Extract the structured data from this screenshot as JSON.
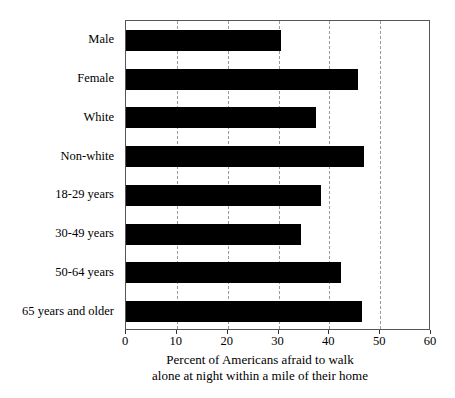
{
  "chart_data": {
    "type": "bar",
    "orientation": "horizontal",
    "title": "",
    "xlabel": "Percent of Americans afraid to walk alone at night within a mile of their home",
    "ylabel": "",
    "xlim": [
      0,
      60
    ],
    "xticks": [
      0,
      10,
      20,
      30,
      40,
      50,
      60
    ],
    "xtick_labels": [
      "0",
      "10",
      "20",
      "30",
      "40",
      "50",
      "60"
    ],
    "gridlines": [
      10,
      20,
      30,
      40,
      50
    ],
    "grid": true,
    "legend": "none",
    "bar_color": "#000000",
    "categories": [
      "Male",
      "Female",
      "White",
      "Non-white",
      "18-29 years",
      "30-49 years",
      "50-64 years",
      "65 years and older"
    ],
    "values": [
      30.5,
      45.6,
      37.4,
      46.8,
      38.4,
      34.4,
      42.3,
      46.4
    ]
  },
  "axis_title": {
    "line1": "Percent of Americans afraid to walk",
    "line2": "alone at night within a mile of their home"
  }
}
